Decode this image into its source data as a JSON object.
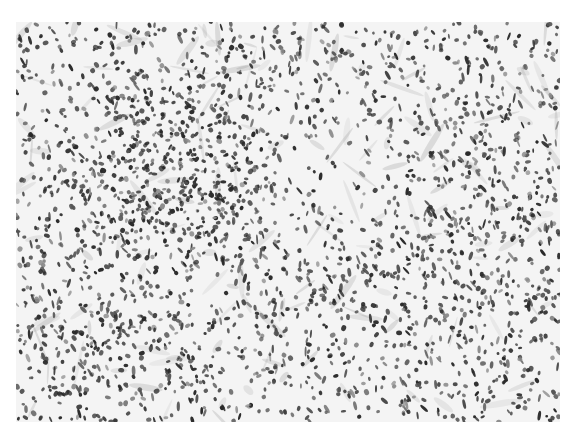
{
  "image": {
    "kind": "grayscale histology micrograph",
    "canvas": {
      "width": 575,
      "height": 435,
      "background": "#ffffff"
    },
    "frame": {
      "x": 16,
      "y": 22,
      "width": 544,
      "height": 400,
      "tissue_background": "#f4f4f4"
    },
    "palette": {
      "nucleus_dark": "#2a2a2a",
      "nucleus_mid": "#555555",
      "nucleus_light": "#8a8a8a",
      "pale_stroma": "#e6e6e6"
    },
    "regions": [
      {
        "name": "lymphoid-follicle",
        "cx": 160,
        "cy": 150,
        "rx": 115,
        "ry": 110,
        "density": 2.6
      },
      {
        "name": "lower-left-cellular-zone",
        "cx": 110,
        "cy": 330,
        "rx": 130,
        "ry": 90,
        "density": 1.5
      },
      {
        "name": "right-cellular-zone",
        "cx": 460,
        "cy": 230,
        "rx": 120,
        "ry": 180,
        "density": 1.5
      },
      {
        "name": "pale-central-zone",
        "cx": 330,
        "cy": 150,
        "rx": 90,
        "ry": 80,
        "density": 0.55
      }
    ],
    "nuclei_count": 2600,
    "seed": 7
  }
}
